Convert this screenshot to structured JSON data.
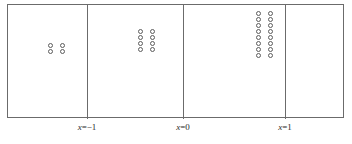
{
  "figure": {
    "type": "concentration-gradient-diagram",
    "background_color": "#ffffff",
    "line_color": "#6b6b6b",
    "circle_stroke_color": "#5c5c5c",
    "text_color": "#2b2b2b"
  },
  "box": {
    "name": "outer-rectangle",
    "x": 7,
    "y": 4,
    "width": 337,
    "height": 114
  },
  "dividers": [
    {
      "name": "divider-x-minus-1",
      "x": 87
    },
    {
      "name": "divider-x-0",
      "x": 183
    },
    {
      "name": "divider-x-1",
      "x": 285
    }
  ],
  "axis_labels": [
    {
      "name": "label-x-minus-1",
      "text": "x=−1",
      "x": 87
    },
    {
      "name": "label-x-0",
      "text": "x=0",
      "x": 183
    },
    {
      "name": "label-x-1",
      "text": "x=1",
      "x": 285
    }
  ],
  "cells": [
    {
      "name": "cell-1",
      "index": 1,
      "circle_count": 4,
      "rows": 2,
      "cols": 2,
      "cluster_left": 44,
      "cluster_top": 42,
      "col_gap": 12,
      "row_gap": 6
    },
    {
      "name": "cell-2",
      "index": 2,
      "circle_count": 8,
      "rows": 4,
      "cols": 2,
      "cluster_left": 134,
      "cluster_top": 28,
      "col_gap": 12,
      "row_gap": 6
    },
    {
      "name": "cell-3",
      "index": 3,
      "circle_count": 16,
      "rows": 8,
      "cols": 2,
      "cluster_left": 252,
      "cluster_top": 10,
      "col_gap": 12,
      "row_gap": 6
    },
    {
      "name": "cell-4",
      "index": 4,
      "circle_count": 0,
      "rows": 0,
      "cols": 0,
      "cluster_left": 0,
      "cluster_top": 0,
      "col_gap": 0,
      "row_gap": 0
    }
  ],
  "chart_data": {
    "type": "scatter",
    "title": "",
    "xlabel": "x",
    "ylabel": "",
    "xtick_labels": [
      "x=−1",
      "x=0",
      "x=1"
    ],
    "xtick_positions": [
      -1,
      0,
      1
    ],
    "grid": false,
    "legend": null,
    "series": [
      {
        "name": "particle-count-per-compartment",
        "categories": [
          "left of x=−1",
          "x=−1 to x=0",
          "x=0 to x=1",
          "right of x=1"
        ],
        "values": [
          4,
          8,
          16,
          0
        ]
      }
    ]
  }
}
